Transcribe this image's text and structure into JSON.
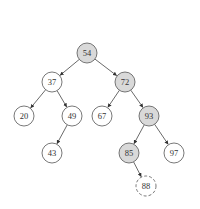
{
  "diagram": {
    "type": "binary-search-tree",
    "colors": {
      "highlight_fill": "#d9d9d9",
      "normal_fill": "#ffffff",
      "stroke": "#555555",
      "edge": "#444444"
    },
    "nodes": [
      {
        "id": "n54",
        "label": "54",
        "x": 87,
        "y": 53,
        "highlighted": true,
        "dashed": false
      },
      {
        "id": "n37",
        "label": "37",
        "x": 52,
        "y": 82,
        "highlighted": false,
        "dashed": false
      },
      {
        "id": "n72",
        "label": "72",
        "x": 125,
        "y": 82,
        "highlighted": true,
        "dashed": false
      },
      {
        "id": "n20",
        "label": "20",
        "x": 24,
        "y": 116,
        "highlighted": false,
        "dashed": false
      },
      {
        "id": "n49",
        "label": "49",
        "x": 72,
        "y": 116,
        "highlighted": false,
        "dashed": false
      },
      {
        "id": "n67",
        "label": "67",
        "x": 102,
        "y": 116,
        "highlighted": false,
        "dashed": false
      },
      {
        "id": "n93",
        "label": "93",
        "x": 149,
        "y": 116,
        "highlighted": true,
        "dashed": false
      },
      {
        "id": "n43",
        "label": "43",
        "x": 52,
        "y": 153,
        "highlighted": false,
        "dashed": false
      },
      {
        "id": "n85",
        "label": "85",
        "x": 129,
        "y": 153,
        "highlighted": true,
        "dashed": false
      },
      {
        "id": "n97",
        "label": "97",
        "x": 174,
        "y": 153,
        "highlighted": false,
        "dashed": false
      },
      {
        "id": "n88",
        "label": "88",
        "x": 146,
        "y": 186,
        "highlighted": false,
        "dashed": true
      }
    ],
    "edges": [
      {
        "from": "n54",
        "to": "n37"
      },
      {
        "from": "n54",
        "to": "n72"
      },
      {
        "from": "n37",
        "to": "n20"
      },
      {
        "from": "n37",
        "to": "n49"
      },
      {
        "from": "n72",
        "to": "n67"
      },
      {
        "from": "n72",
        "to": "n93"
      },
      {
        "from": "n49",
        "to": "n43"
      },
      {
        "from": "n93",
        "to": "n85"
      },
      {
        "from": "n93",
        "to": "n97"
      },
      {
        "from": "n85",
        "to": "n88"
      }
    ]
  }
}
